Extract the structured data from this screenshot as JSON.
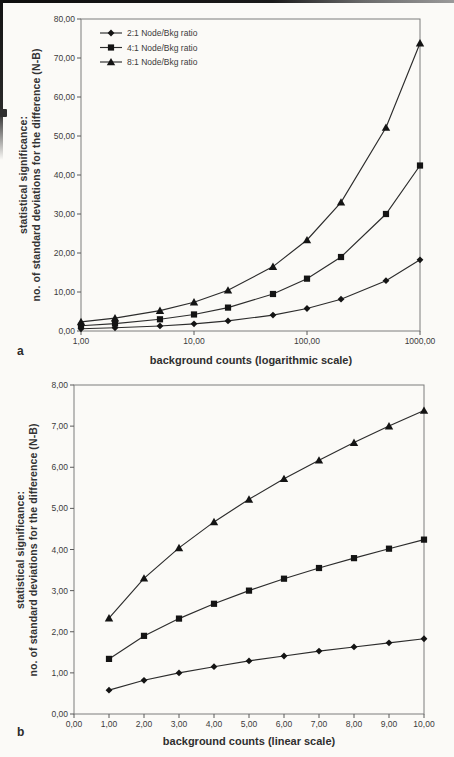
{
  "colors": {
    "background": "#fbfaf7",
    "frame": "#7d7d7d",
    "tick": "#5a5a5a",
    "line": "#2c2c2c",
    "marker": "#141414",
    "text": "#3b3b3b",
    "scan_edge": "#141414"
  },
  "chart_data": [
    {
      "id": "a",
      "panel_label": "a",
      "type": "line",
      "x_scale": "log",
      "xlabel": "background counts (logarithmic scale)",
      "ylabel_line1": "statistical significance:",
      "ylabel_line2": "no. of standard deviations for the difference (N-B)",
      "xlim": [
        1,
        1000
      ],
      "ylim": [
        0,
        80
      ],
      "x_ticks": [
        1,
        10,
        100,
        1000
      ],
      "x_tick_labels": [
        "1,00",
        "10,00",
        "100,00",
        "1000,00"
      ],
      "y_ticks": [
        0,
        10,
        20,
        30,
        40,
        50,
        60,
        70,
        80
      ],
      "y_tick_labels": [
        "0,00",
        "10,00",
        "20,00",
        "30,00",
        "40,00",
        "50,00",
        "60,00",
        "70,00",
        "80,00"
      ],
      "grid": false,
      "legend_position": "top-left",
      "x": [
        1,
        2,
        5,
        10,
        20,
        50,
        100,
        200,
        500,
        1000
      ],
      "series": [
        {
          "name": "2:1 Node/Bkg ratio",
          "marker": "diamond",
          "values": [
            0.58,
            0.82,
            1.29,
            1.83,
            2.58,
            4.08,
            5.77,
            8.16,
            12.91,
            18.26
          ]
        },
        {
          "name": "4:1 Node/Bkg ratio",
          "marker": "square",
          "values": [
            1.34,
            1.9,
            3.0,
            4.24,
            6.0,
            9.49,
            13.42,
            18.97,
            30.0,
            42.43
          ]
        },
        {
          "name": "8:1 Node/Bkg ratio",
          "marker": "triangle",
          "values": [
            2.33,
            3.3,
            5.22,
            7.38,
            10.43,
            16.5,
            23.33,
            33.0,
            52.17,
            73.79
          ]
        }
      ]
    },
    {
      "id": "b",
      "panel_label": "b",
      "type": "line",
      "x_scale": "linear",
      "xlabel": "background counts (linear scale)",
      "ylabel_line1": "statistical significance:",
      "ylabel_line2": "no. of standard deviations for the difference (N-B)",
      "xlim": [
        0,
        10
      ],
      "ylim": [
        0,
        8
      ],
      "x_ticks": [
        0,
        1,
        2,
        3,
        4,
        5,
        6,
        7,
        8,
        9,
        10
      ],
      "x_tick_labels": [
        "0,00",
        "1,00",
        "2,00",
        "3,00",
        "4,00",
        "5,00",
        "6,00",
        "7,00",
        "8,00",
        "9,00",
        "10,00"
      ],
      "y_ticks": [
        0,
        1,
        2,
        3,
        4,
        5,
        6,
        7,
        8
      ],
      "y_tick_labels": [
        "0,00",
        "1,00",
        "2,00",
        "3,00",
        "4,00",
        "5,00",
        "6,00",
        "7,00",
        "8,00"
      ],
      "grid": false,
      "legend_position": null,
      "x": [
        1,
        2,
        3,
        4,
        5,
        6,
        7,
        8,
        9,
        10
      ],
      "series": [
        {
          "name": "2:1 Node/Bkg ratio",
          "marker": "diamond",
          "values": [
            0.58,
            0.82,
            1.0,
            1.15,
            1.29,
            1.41,
            1.53,
            1.63,
            1.73,
            1.83
          ]
        },
        {
          "name": "4:1 Node/Bkg ratio",
          "marker": "square",
          "values": [
            1.34,
            1.9,
            2.32,
            2.68,
            3.0,
            3.29,
            3.55,
            3.79,
            4.02,
            4.24
          ]
        },
        {
          "name": "8:1 Node/Bkg ratio",
          "marker": "triangle",
          "values": [
            2.33,
            3.3,
            4.04,
            4.67,
            5.22,
            5.72,
            6.17,
            6.6,
            7.0,
            7.38
          ]
        }
      ]
    }
  ]
}
